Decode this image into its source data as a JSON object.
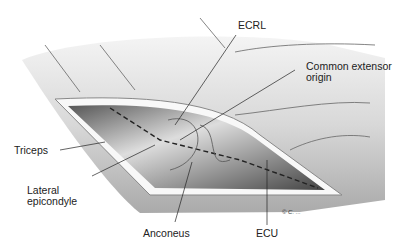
{
  "figure": {
    "labels": {
      "ecrl": "ECRL",
      "common_extensor_1": "Common extensor",
      "common_extensor_2": "origin",
      "triceps": "Triceps",
      "lateral_1": "Lateral",
      "lateral_2": "epicondyle",
      "anconeus": "Anconeus",
      "ecu": "ECU"
    },
    "signature": "© C. ..."
  }
}
